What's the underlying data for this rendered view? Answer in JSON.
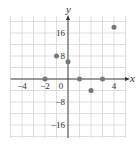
{
  "chart_data": {
    "type": "scatter",
    "title": "",
    "xlabel": "x",
    "ylabel": "y",
    "xlim": [
      -5,
      5
    ],
    "ylim": [
      -20,
      20
    ],
    "grid": true,
    "x_grid_step": 1,
    "y_grid_step": 4,
    "x_ticks": [
      -4,
      -2,
      0,
      4
    ],
    "x_tick_labels": [
      "-4",
      "-2",
      "0",
      "4"
    ],
    "y_ticks": [
      16,
      8,
      -8,
      -16
    ],
    "y_tick_labels": [
      "16",
      "8",
      "-8",
      "-16"
    ],
    "series": [
      {
        "name": "points",
        "color": "#777777",
        "points": [
          {
            "x": -2,
            "y": 0
          },
          {
            "x": -1,
            "y": 8
          },
          {
            "x": 0,
            "y": 6
          },
          {
            "x": 1,
            "y": 0
          },
          {
            "x": 2,
            "y": -4
          },
          {
            "x": 3,
            "y": 0
          },
          {
            "x": 4,
            "y": 18
          }
        ]
      }
    ]
  },
  "colors": {
    "grid": "#d6d6d6",
    "axis": "#333333",
    "point": "#777777"
  }
}
